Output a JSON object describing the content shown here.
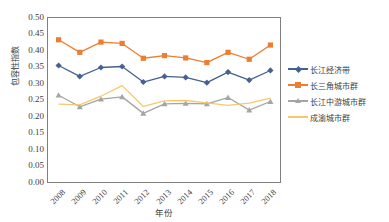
{
  "chart_data": {
    "type": "line",
    "title": "",
    "xlabel": "年份",
    "ylabel": "包容性指数",
    "categories": [
      "2008",
      "2009",
      "2010",
      "2011",
      "2012",
      "2013",
      "2014",
      "2015",
      "2016",
      "2017",
      "2018"
    ],
    "ylim": [
      0.0,
      0.5
    ],
    "ytick_labels": [
      "0.50",
      "0.45",
      "0.40",
      "0.35",
      "0.30",
      "0.25",
      "0.20",
      "0.15",
      "0.10",
      "0.05",
      "0.00"
    ],
    "ytick_values": [
      0.5,
      0.45,
      0.4,
      0.35,
      0.3,
      0.25,
      0.2,
      0.15,
      0.1,
      0.05,
      0.0
    ],
    "grid": false,
    "legend_position": "right",
    "series": [
      {
        "name": "长江经济带",
        "color": "#44618f",
        "marker": "diamond",
        "values": [
          0.356,
          0.323,
          0.35,
          0.353,
          0.306,
          0.323,
          0.32,
          0.304,
          0.336,
          0.312,
          0.341
        ]
      },
      {
        "name": "长三角城市群",
        "color": "#ed7d31",
        "marker": "square",
        "values": [
          0.434,
          0.396,
          0.427,
          0.423,
          0.378,
          0.386,
          0.379,
          0.365,
          0.396,
          0.375,
          0.418
        ]
      },
      {
        "name": "长江中游城市群",
        "color": "#a5a5a5",
        "marker": "triangle",
        "values": [
          0.266,
          0.231,
          0.254,
          0.261,
          0.211,
          0.24,
          0.241,
          0.24,
          0.259,
          0.221,
          0.247
        ]
      },
      {
        "name": "成渝城市群",
        "color": "#f5c96b",
        "marker": "none",
        "values": [
          0.239,
          0.237,
          0.263,
          0.295,
          0.232,
          0.249,
          0.25,
          0.243,
          0.235,
          0.242,
          0.257
        ]
      }
    ]
  },
  "axis": {
    "x_title": "年份",
    "y_title": "包容性指数"
  }
}
